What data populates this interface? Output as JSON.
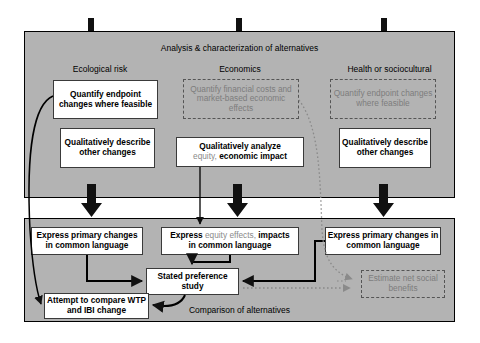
{
  "diagram": {
    "panels": {
      "top": {
        "label": "Analysis & characterization of alternatives"
      },
      "bottom": {
        "label": "Comparison of alternatives"
      }
    },
    "columns": [
      {
        "heading": "Ecological risk"
      },
      {
        "heading": "Economics"
      },
      {
        "heading": "Health or sociocultural"
      }
    ],
    "boxes": {
      "quantify_endpoint_left": {
        "text": "Quantify endpoint changes where feasible",
        "style": "solid"
      },
      "qualitatively_describe_left": {
        "text": "Qualitatively describe other changes",
        "style": "solid"
      },
      "quantify_financial": {
        "text": "Quantify financial costs and market-based economic effects",
        "style": "dashed"
      },
      "qualitatively_analyze": {
        "line1_bold": "Qualitatively analyze",
        "line2_gray": "equity,",
        "line2_bold": "economic impact",
        "style": "solid"
      },
      "quantify_endpoint_right": {
        "text": "Quantify endpoint changes where feasible",
        "style": "dashed"
      },
      "qualitatively_describe_right": {
        "text": "Qualitatively describe other changes",
        "style": "solid"
      },
      "express_primary_left": {
        "text": "Express primary changes in common language",
        "style": "solid"
      },
      "express_equity": {
        "w1_bold": "Express",
        "w2_gray": "equity effects,",
        "w3_bold": "impacts",
        "line2_bold": "in common language",
        "style": "solid"
      },
      "express_primary_right": {
        "text": "Express primary changes in common language",
        "style": "solid"
      },
      "stated_preference": {
        "text": "Stated preference study",
        "style": "solid"
      },
      "attempt_compare": {
        "text": "Attempt to compare WTP and IBI change",
        "style": "solid"
      },
      "estimate_net": {
        "text": "Estimate net social benefits",
        "style": "dashed"
      }
    },
    "colors": {
      "panel_fill": "#b3b3b3",
      "box_fill": "#ffffff",
      "outline": "#000000",
      "dashed_gray": "#7d7d7d",
      "arrow_black": "#111111",
      "dotted_gray": "#8a8a8a"
    },
    "connectors": {
      "thick_arrows": 3,
      "tabs": 3
    }
  }
}
